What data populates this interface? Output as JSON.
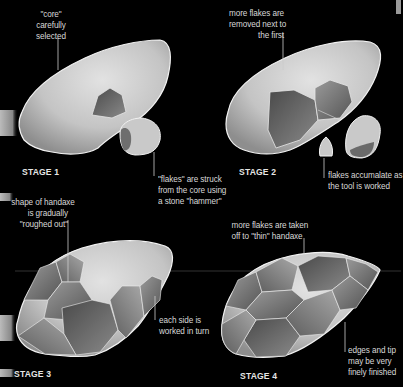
{
  "diagram": {
    "colors": {
      "background": "#000000",
      "stone_light": "#d4d4d4",
      "stone_dark": "#6a6a6a",
      "outline": "#f2f2f2",
      "text": "#d8d8d8"
    },
    "stages": [
      {
        "title": "STAGE 1",
        "annotations": [
          {
            "lines": [
              "\"core\"",
              "carefully",
              "selected"
            ]
          },
          {
            "lines": [
              "\"flakes\" are struck",
              "from the core using",
              "a stone \"hammer\""
            ]
          }
        ]
      },
      {
        "title": "STAGE 2",
        "annotations": [
          {
            "lines": [
              "more flakes are",
              "removed next to",
              "the first"
            ]
          },
          {
            "lines": [
              "flakes accumalate as",
              "the tool is worked"
            ]
          }
        ]
      },
      {
        "title": "STAGE 3",
        "annotations": [
          {
            "lines": [
              "shape of handaxe",
              "is gradually",
              "\"roughed out\""
            ]
          },
          {
            "lines": [
              "each side is",
              "worked in turn"
            ]
          }
        ]
      },
      {
        "title": "STAGE 4",
        "annotations": [
          {
            "lines": [
              "more flakes are taken",
              "off to \"thin\" handaxe"
            ]
          },
          {
            "lines": [
              "edges and tip",
              "may be very",
              "finely finished"
            ]
          }
        ]
      }
    ]
  }
}
